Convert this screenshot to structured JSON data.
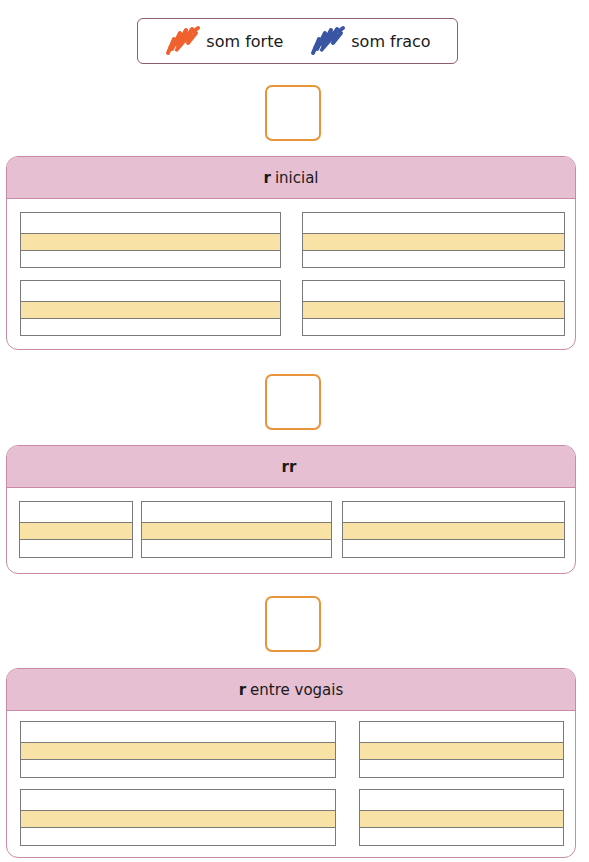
{
  "legend": {
    "items": [
      {
        "label": "som forte",
        "color": "#f0612e",
        "icon": "orange-scribble-icon"
      },
      {
        "label": "som fraco",
        "color": "#3a55a4",
        "icon": "blue-scribble-icon"
      }
    ]
  },
  "answer_box_color": "#e8943a",
  "sections": [
    {
      "title_bold": "r",
      "title_rest": "inicial",
      "rows": 2,
      "columns_per_row": 2
    },
    {
      "title_bold": "rr",
      "title_rest": "",
      "rows": 1,
      "columns_per_row": 3
    },
    {
      "title_bold": "r",
      "title_rest": "entre vogais",
      "rows": 2,
      "columns_per_row": 2
    }
  ],
  "colors": {
    "section_header": "#e6bfd2",
    "section_border": "#c98aa8",
    "writing_band": "#f8e2a6",
    "legend_border": "#8e5b6e"
  }
}
